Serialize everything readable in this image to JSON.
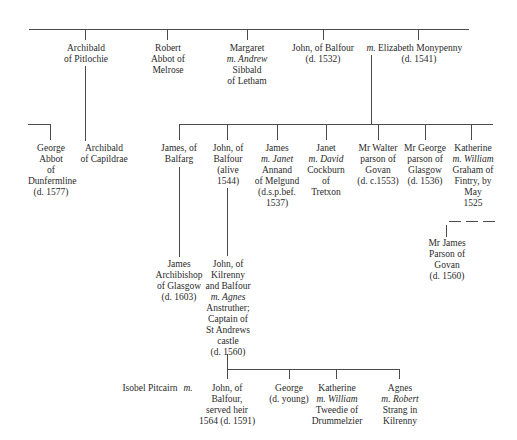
{
  "generation1": [
    {
      "id": "archibald-pitlochie",
      "lines": [
        "Archibald",
        "of Pitlochie"
      ]
    },
    {
      "id": "robert-melrose",
      "lines": [
        "Robert",
        "Abbot of",
        "Melrose"
      ]
    },
    {
      "id": "margaret",
      "lines": [
        "Margaret",
        "m. Andrew",
        "Sibbald",
        "of Letham"
      ]
    },
    {
      "id": "john-balfour-1532",
      "lines": [
        "John, of Balfour",
        "(d. 1532)"
      ]
    },
    {
      "id": "marriage-mark-1",
      "lines": [
        "m."
      ]
    },
    {
      "id": "elizabeth-monypenny",
      "lines": [
        "Elizabeth Monypenny",
        "(d. 1541)"
      ]
    }
  ],
  "generation2_left": [
    {
      "id": "george-dunfermline",
      "lines": [
        "George",
        "Abbot",
        "of",
        "Dunfermline",
        "(d. 1577)"
      ]
    },
    {
      "id": "archibald-capildrae",
      "lines": [
        "Archibald",
        "of Capildrae"
      ]
    }
  ],
  "generation2": [
    {
      "id": "james-balfarg",
      "lines": [
        "James, of",
        "Balfarg"
      ]
    },
    {
      "id": "john-balfour-1544",
      "lines": [
        "John, of",
        "Balfour",
        "(alive",
        "1544)"
      ]
    },
    {
      "id": "james-annand",
      "lines": [
        "James",
        "m. Janet",
        "Annand",
        "of Melgund",
        "(d.s.p.bef.",
        "1537)"
      ]
    },
    {
      "id": "janet-cockburn",
      "lines": [
        "Janet",
        "m. David",
        "Cockburn",
        "of",
        "Tretxon"
      ]
    },
    {
      "id": "walter-govan",
      "lines": [
        "Mr Walter",
        "parson of",
        "Govan",
        "(d. c.1553)"
      ]
    },
    {
      "id": "george-glasgow",
      "lines": [
        "Mr George",
        "parson of",
        "Glasgow",
        "(d. 1536)"
      ]
    },
    {
      "id": "katherine-graham",
      "lines": [
        "Katherine",
        "m. William",
        "Graham of",
        "Fintry, by",
        "May",
        "1525"
      ]
    }
  ],
  "generation3": [
    {
      "id": "james-archbishop",
      "lines": [
        "James",
        "Archibishop",
        "of Glasgow",
        "(d. 1603)"
      ]
    },
    {
      "id": "john-kilrenny",
      "lines": [
        "John, of",
        "Kilrenny",
        "and Balfour",
        "m. Agnes",
        "Anstruther;",
        "Captain of",
        "St Andrews",
        "castle",
        "(d. 1560)"
      ]
    },
    {
      "id": "james-parson-govan",
      "lines": [
        "Mr James",
        "Parson of",
        "Govan",
        "(d. 1560)"
      ]
    }
  ],
  "generation4": [
    {
      "id": "isobel-pitcairn",
      "lines": [
        "Isobel Pitcairn"
      ]
    },
    {
      "id": "marriage-mark-2",
      "lines": [
        "m."
      ]
    },
    {
      "id": "john-served-heir",
      "lines": [
        "John, of",
        "Balfour,",
        "served heir",
        "1564 (d. 1591)"
      ]
    },
    {
      "id": "george-young",
      "lines": [
        "George",
        "(d. young)"
      ]
    },
    {
      "id": "katherine-tweedie",
      "lines": [
        "Katherine",
        "m. William",
        "Tweedie of",
        "Drummelzier"
      ]
    },
    {
      "id": "agnes-strang",
      "lines": [
        "Agnes",
        "m. Robert",
        "Strang in",
        "Kilrenny"
      ]
    }
  ]
}
